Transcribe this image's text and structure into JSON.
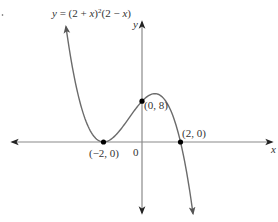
{
  "chart_data": {
    "type": "line",
    "equation_label": "y = (2 + x)²(2 − x)",
    "xlabel": "x",
    "ylabel": "y",
    "origin_label": "0",
    "xlim": [
      -6.8,
      6.9
    ],
    "ylim": [
      -14.5,
      23.5
    ],
    "grid": false,
    "legend": null,
    "series": [
      {
        "name": "y = (2 + x)^2(2 - x)",
        "x_range": [
          -3.95,
          2.65
        ],
        "key_points": [
          {
            "x": -2,
            "y": 0,
            "label": "(−2, 0)"
          },
          {
            "x": 0,
            "y": 8,
            "label": "(0, 8)"
          },
          {
            "x": 2,
            "y": 0,
            "label": "(2, 0)"
          }
        ],
        "local_min": {
          "x": -2,
          "y": 0
        },
        "local_max": {
          "x": 0.667,
          "y": 9.48
        }
      }
    ]
  },
  "labels": {
    "equation_y": "y",
    "equation_rest": " = (2 + ",
    "eq_x1": "x",
    "eq_sq": ")",
    "eq_sup": "2",
    "eq_tail": "(2 − ",
    "eq_x2": "x",
    "eq_close": ")",
    "x_axis": "x",
    "y_axis": "y",
    "origin": "0",
    "p1": "(−2, 0)",
    "p2": "(0, 8)",
    "p3": "(2, 0)"
  },
  "colors": {
    "axis": "#8a8a8a",
    "curve": "#6b6b6b",
    "point": "#000000",
    "text": "#333333"
  }
}
